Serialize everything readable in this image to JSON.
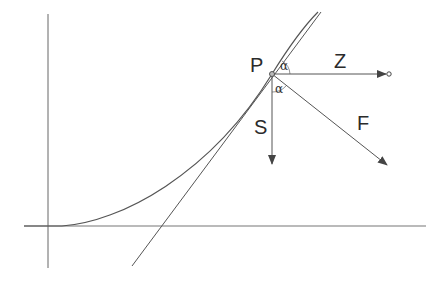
{
  "diagram": {
    "labels": {
      "point": "P",
      "horizontal_force": "Z",
      "vertical_force": "S",
      "resultant_force": "F",
      "angle_upper": "α",
      "angle_lower": "α"
    },
    "colors": {
      "stroke": "#555555",
      "text": "#2b2b2b",
      "background": "#ffffff"
    },
    "elements": [
      {
        "id": "y-axis",
        "type": "line",
        "desc": "vertical axis"
      },
      {
        "id": "x-axis",
        "type": "line",
        "desc": "horizontal axis"
      },
      {
        "id": "curve",
        "type": "curve",
        "desc": "rising curve through P"
      },
      {
        "id": "tangent",
        "type": "line",
        "desc": "tangent line at P"
      },
      {
        "id": "Z",
        "type": "arrow",
        "desc": "horizontal arrow from P"
      },
      {
        "id": "S",
        "type": "arrow",
        "desc": "vertical downward arrow from P"
      },
      {
        "id": "F",
        "type": "arrow",
        "desc": "diagonal resultant arrow from P"
      }
    ]
  }
}
